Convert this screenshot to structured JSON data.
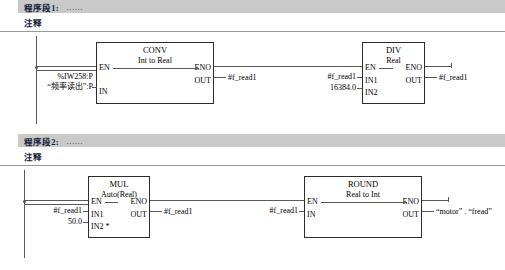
{
  "networks": [
    {
      "segment_label": "程序段1:",
      "dots": "......",
      "comment": "注释",
      "blocks": [
        {
          "name": "CONV",
          "subtitle": "Int to Real",
          "pins": {
            "en": "EN",
            "eno": "ENO",
            "in": "IN",
            "out": "OUT"
          }
        },
        {
          "name": "DIV",
          "subtitle": "Real",
          "pins": {
            "en": "EN",
            "eno": "ENO",
            "in1": "IN1",
            "in2": "IN2",
            "out": "OUT"
          }
        }
      ],
      "operands": {
        "conv_in_line1": "%IW258:P",
        "conv_in_line2": "“频率读出”:P",
        "conv_out": "#f_read1",
        "div_in1": "#f_read1",
        "div_in2": "16384.0",
        "div_out": "#f_read1"
      }
    },
    {
      "segment_label": "程序段2:",
      "dots": "......",
      "comment": "注释",
      "blocks": [
        {
          "name": "MUL",
          "subtitle": "Auto(Real)",
          "pins": {
            "en": "EN",
            "eno": "ENO",
            "in1": "IN1",
            "in2": "IN2 *",
            "out": "OUT"
          }
        },
        {
          "name": "ROUND",
          "subtitle": "Real to Int",
          "pins": {
            "en": "EN",
            "eno": "ENO",
            "in": "IN",
            "out": "OUT"
          }
        }
      ],
      "operands": {
        "mul_in1": "#f_read1",
        "mul_in2": "50.0",
        "mul_out": "#f_read1",
        "round_in": "#f_read1",
        "round_out": "“motor” . “fread”"
      }
    }
  ],
  "colors": {
    "header_band": "#c9c9c9",
    "title_text": "#14213a",
    "line": "#5a5a5a",
    "block_border": "#2d2d2d"
  }
}
